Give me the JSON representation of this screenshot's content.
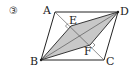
{
  "problem_number": "③",
  "figure": {
    "type": "parallelogram",
    "vertices": {
      "A": {
        "label": "A",
        "x": 55,
        "y": 12
      },
      "B": {
        "label": "B",
        "x": 41,
        "y": 60
      },
      "C": {
        "label": "C",
        "x": 104,
        "y": 60
      },
      "D": {
        "label": "D",
        "x": 118,
        "y": 12
      }
    },
    "points": {
      "E": {
        "label": "E",
        "x": 71,
        "y": 26
      },
      "F": {
        "label": "F",
        "x": 90,
        "y": 45
      }
    },
    "shaded_region": [
      "B",
      "E",
      "D",
      "F"
    ],
    "shade_color": "#c8c8c8",
    "line_color": "#222222"
  }
}
